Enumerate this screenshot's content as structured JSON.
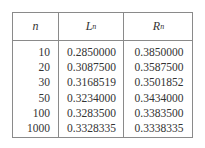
{
  "table": {
    "headers": {
      "n": "n",
      "L_base": "L",
      "L_sub": "n",
      "R_base": "R",
      "R_sub": "n"
    },
    "rows": [
      {
        "n": "10",
        "L": "0.2850000",
        "R": "0.3850000"
      },
      {
        "n": "20",
        "L": "0.3087500",
        "R": "0.3587500"
      },
      {
        "n": "30",
        "L": "0.3168519",
        "R": "0.3501852"
      },
      {
        "n": "50",
        "L": "0.3234000",
        "R": "0.3434000"
      },
      {
        "n": "100",
        "L": "0.3283500",
        "R": "0.3383500"
      },
      {
        "n": "1000",
        "L": "0.3328335",
        "R": "0.3338335"
      }
    ]
  }
}
